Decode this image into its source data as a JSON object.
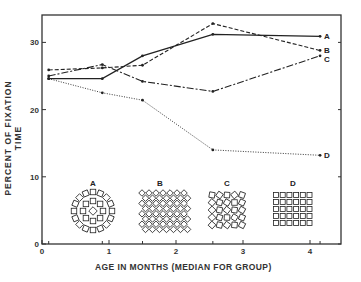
{
  "chart_data": {
    "type": "line",
    "title": "",
    "xlabel": "AGE IN MONTHS (MEDIAN FOR GROUP)",
    "ylabel": "PERCENT OF FIXATION TIME",
    "xlim": [
      0,
      4.5
    ],
    "ylim": [
      0,
      34
    ],
    "xticks": [
      0,
      1,
      2,
      3,
      4
    ],
    "xtick_labels": [
      "0",
      "1",
      "2",
      "3",
      "4"
    ],
    "yticks": [
      0,
      10,
      20,
      30
    ],
    "ytick_labels": [
      "0",
      "10",
      "20",
      "30"
    ],
    "grid": false,
    "x": [
      0.1,
      0.9,
      1.5,
      2.55,
      4.15
    ],
    "series": [
      {
        "name": "A",
        "style": "solid",
        "values": [
          24.6,
          24.6,
          28.0,
          31.2,
          30.9
        ]
      },
      {
        "name": "B",
        "style": "dashed",
        "values": [
          25.9,
          26.2,
          26.6,
          32.8,
          28.8
        ]
      },
      {
        "name": "C",
        "style": "long-dash",
        "values": [
          25.0,
          26.7,
          24.2,
          22.7,
          28.0
        ]
      },
      {
        "name": "D",
        "style": "dotted",
        "values": [
          24.6,
          22.5,
          21.4,
          14.0,
          13.2
        ]
      }
    ],
    "legend": "line-end labels A, B, C, D",
    "annotations": [
      {
        "label": "A",
        "description": "concentric rings of squares pattern"
      },
      {
        "label": "B",
        "description": "diamond lattice pattern"
      },
      {
        "label": "C",
        "description": "randomly rotated squares pattern"
      },
      {
        "label": "D",
        "description": "regular grid of squares pattern"
      }
    ]
  },
  "labels": {
    "ylabel": "PERCENT OF FIXATION TIME",
    "xlabel": "AGE IN MONTHS (MEDIAN FOR GROUP)",
    "pattern_a": "A",
    "pattern_b": "B",
    "pattern_c": "C",
    "pattern_d": "D"
  }
}
